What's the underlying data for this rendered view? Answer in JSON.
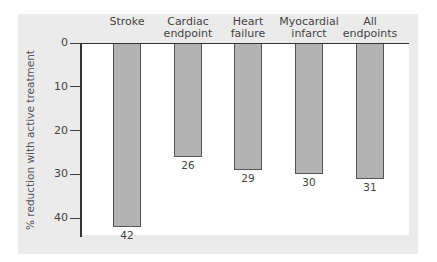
{
  "chart_data": {
    "type": "bar",
    "title": "",
    "orientation": "vertical-downward",
    "categories": [
      "Stroke",
      "Cardiac endpoint",
      "Heart failure",
      "Myocardial infarct",
      "All endpoints"
    ],
    "category_lines": [
      [
        "Stroke"
      ],
      [
        "Cardiac",
        "endpoint"
      ],
      [
        "Heart",
        "failure"
      ],
      [
        "Myocardial",
        "infarct"
      ],
      [
        "All",
        "endpoints"
      ]
    ],
    "values": [
      42,
      26,
      29,
      30,
      31
    ],
    "value_labels": [
      "42",
      "26",
      "29",
      "30",
      "31"
    ],
    "xlabel": "",
    "ylabel": "% reduction with active treatment",
    "ylim": [
      0,
      45
    ],
    "yticks": [
      0,
      10,
      20,
      30,
      40
    ],
    "ytick_labels": [
      "0",
      "10",
      "20",
      "30",
      "40"
    ],
    "grid": false,
    "legend": null,
    "colors": {
      "bar": "#b3b3b3",
      "bar_border": "#555555",
      "panel": "#ebebeb",
      "plot": "#ffffff",
      "axis": "#333333"
    }
  }
}
